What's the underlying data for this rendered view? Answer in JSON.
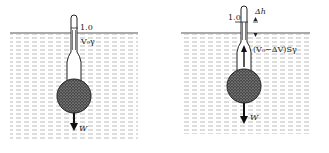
{
  "diagram": {
    "colors": {
      "ink": "#222222",
      "water_dash": "#9a9a9a",
      "bulb": "#555555",
      "surface": "#555555"
    },
    "left_panel": {
      "scale_mark": "1.0",
      "buoyancy_label": "V₀γ",
      "weight_label": "W"
    },
    "right_panel": {
      "scale_mark": "1.0",
      "delta_label": "Δh",
      "buoyancy_label": "(V₀−ΔV)Sγ",
      "weight_label": "W"
    }
  }
}
